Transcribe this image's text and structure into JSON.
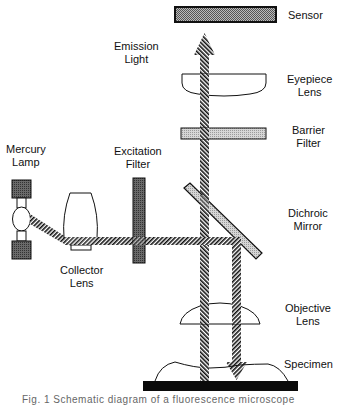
{
  "diagram": {
    "labels": {
      "sensor": [
        "Sensor"
      ],
      "emission_light": [
        "Emission",
        "Light"
      ],
      "eyepiece_lens": [
        "Eyepiece",
        "Lens"
      ],
      "barrier_filter": [
        "Barrier",
        "Filter"
      ],
      "mercury_lamp": [
        "Mercury",
        "Lamp"
      ],
      "excitation_filter": [
        "Excitation",
        "Filter"
      ],
      "dichroic_mirror": [
        "Dichroic",
        "Mirror"
      ],
      "collector_lens": [
        "Collector",
        "Lens"
      ],
      "objective_lens": [
        "Objective",
        "Lens"
      ],
      "specimen": [
        "Specimen"
      ]
    },
    "caption": "Fig. 1   Schematic diagram of a fluorescence microscope",
    "colors": {
      "line": "#111111",
      "sensor_fill": "#8a8a8a",
      "barrier_fill": "#c8c8c8",
      "mirror_fill": "#a8a8a8",
      "excitation_fill": "#5a5a5a",
      "lamp_fill": "#555555",
      "slide_fill": "#0a0a0a"
    }
  }
}
